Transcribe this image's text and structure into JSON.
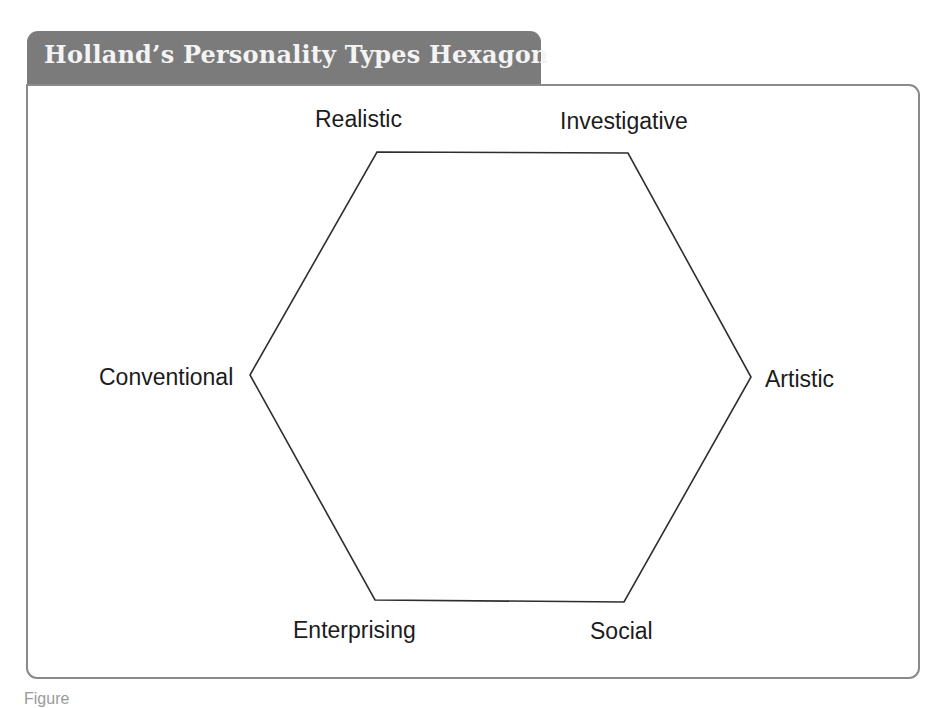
{
  "header": {
    "title": "Holland’s Personality Types Hexagon"
  },
  "diagram": {
    "type": "hexagon",
    "line_color": "#2e2e2e",
    "vertices": [
      {
        "name": "realistic",
        "x": 377,
        "y": 152
      },
      {
        "name": "investigative",
        "x": 628,
        "y": 153
      },
      {
        "name": "artistic",
        "x": 751,
        "y": 377
      },
      {
        "name": "social",
        "x": 624,
        "y": 602
      },
      {
        "name": "enterprising",
        "x": 375,
        "y": 600
      },
      {
        "name": "conventional",
        "x": 250,
        "y": 375
      }
    ],
    "labels": {
      "realistic": "Realistic",
      "investigative": "Investigative",
      "artistic": "Artistic",
      "social": "Social",
      "enterprising": "Enterprising",
      "conventional": "Conventional"
    }
  },
  "colors": {
    "tab_background": "#7b7b7b",
    "tab_text": "#f4f4f4",
    "frame_border": "#8a8a8a"
  },
  "caption": {
    "text": "Figure"
  }
}
